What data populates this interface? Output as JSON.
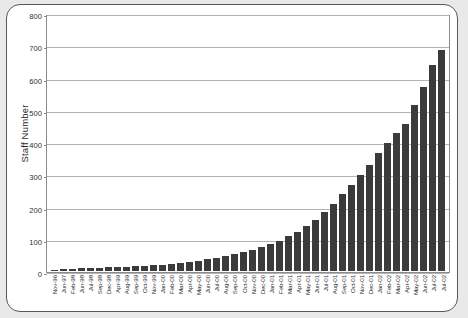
{
  "chart_data": {
    "type": "bar",
    "title": "",
    "xlabel": "",
    "ylabel": "Staff Number",
    "ylim": [
      0,
      800
    ],
    "ytick_values": [
      0,
      100,
      200,
      300,
      400,
      500,
      600,
      700,
      800
    ],
    "ytick_labels": [
      "0",
      "100",
      "200",
      "300",
      "400",
      "500",
      "600",
      "700",
      "800"
    ],
    "grid": true,
    "legend": "none",
    "bar_color": "#3b3b3b",
    "categories": [
      "Nov-96",
      "Jun-97",
      "Feb-98",
      "Jun-98",
      "Jul-98",
      "Sep-98",
      "Dec-98",
      "Apr-99",
      "Aug-99",
      "Sep-99",
      "Oct-99",
      "Nov-99",
      "Jan-00",
      "Feb-00",
      "Mar-00",
      "Apr-00",
      "May-00",
      "Jun-00",
      "Jul-00",
      "Aug-00",
      "Sep-00",
      "Oct-00",
      "Nov-00",
      "Dec-00",
      "Jan-01",
      "Feb-01",
      "Mar-01",
      "Apr-01",
      "May-01",
      "Jun-01",
      "Jul-01",
      "Aug-01",
      "Sep-01",
      "Oct-01",
      "Nov-01",
      "Dec-01",
      "Jan-02",
      "Feb-02",
      "Mar-02",
      "Apr-02",
      "May-02",
      "Jun-02",
      "Jul-02"
    ],
    "values": [
      3,
      5,
      7,
      8,
      9,
      10,
      11,
      12,
      14,
      15,
      16,
      18,
      20,
      22,
      25,
      28,
      32,
      36,
      40,
      46,
      52,
      58,
      66,
      74,
      84,
      95,
      108,
      122,
      140,
      160,
      185,
      210,
      240,
      270,
      300,
      330,
      370,
      400,
      430,
      460,
      520,
      575,
      645
    ],
    "final_value": 690,
    "final_category": "Jul-02"
  }
}
